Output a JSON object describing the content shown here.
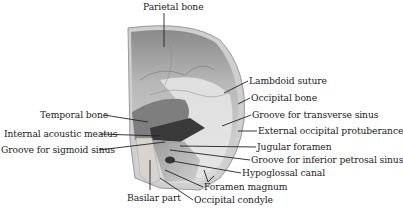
{
  "diagram": {
    "labels": [
      {
        "id": "parietal-bone",
        "text": "Parietal bone",
        "x": 143,
        "y": 2
      },
      {
        "id": "lambdoid-suture",
        "text": "Lambdoid suture",
        "x": 249,
        "y": 76
      },
      {
        "id": "occipital-bone",
        "text": "Occipital bone",
        "x": 251,
        "y": 93
      },
      {
        "id": "groove-transverse-sinus",
        "text": "Groove for transverse sinus",
        "x": 252,
        "y": 110
      },
      {
        "id": "external-occipital-protuberance",
        "text": "External occipital protuberance",
        "x": 258,
        "y": 126
      },
      {
        "id": "jugular-foramen",
        "text": "Jugular foramen",
        "x": 257,
        "y": 142
      },
      {
        "id": "groove-inferior-petrosal-sinus",
        "text": "Groove for inferior petrosal sinus",
        "x": 251,
        "y": 155
      },
      {
        "id": "hypoglossal-canal",
        "text": "Hypoglossal canal",
        "x": 242,
        "y": 168
      },
      {
        "id": "foramen-magnum",
        "text": "Foramen magnum",
        "x": 204,
        "y": 182
      },
      {
        "id": "occipital-condyle",
        "text": "Occipital condyle",
        "x": 194,
        "y": 195
      },
      {
        "id": "temporal-bone",
        "text": "Temporal bone",
        "x": 40,
        "y": 110
      },
      {
        "id": "internal-acoustic-meatus",
        "text": "Internal acoustic meatus",
        "x": 4,
        "y": 129
      },
      {
        "id": "groove-sigmoid-sinus",
        "text": "Groove for sigmoid sinus",
        "x": 1,
        "y": 145
      },
      {
        "id": "basilar-part",
        "text": "Basilar part",
        "x": 127,
        "y": 193
      }
    ]
  }
}
